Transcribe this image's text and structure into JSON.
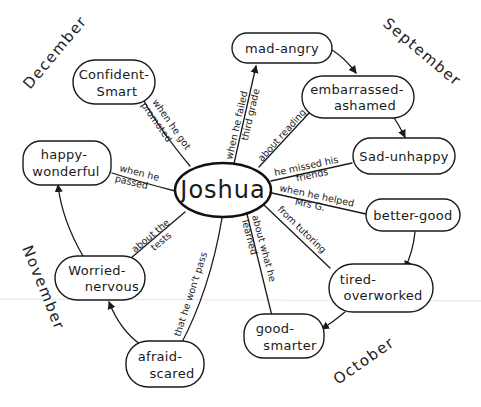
{
  "diagram": {
    "type": "concept-map",
    "center": {
      "label": "Joshua"
    },
    "months": [
      {
        "id": "september",
        "label": "September"
      },
      {
        "id": "october",
        "label": "October"
      },
      {
        "id": "november",
        "label": "November"
      },
      {
        "id": "december",
        "label": "December"
      }
    ],
    "nodes": [
      {
        "id": "mad-angry",
        "lines": [
          "mad-angry"
        ]
      },
      {
        "id": "embarrassed-ashamed",
        "lines": [
          "embarrassed-",
          "ashamed"
        ]
      },
      {
        "id": "sad-unhappy",
        "lines": [
          "Sad-unhappy"
        ]
      },
      {
        "id": "better-good",
        "lines": [
          "better-good"
        ]
      },
      {
        "id": "tired-overworked",
        "lines": [
          "tired-",
          "overworked"
        ]
      },
      {
        "id": "good-smarter",
        "lines": [
          "good-",
          "smarter"
        ]
      },
      {
        "id": "afraid-scared",
        "lines": [
          "afraid-",
          "scared"
        ]
      },
      {
        "id": "worried-nervous",
        "lines": [
          "Worried-",
          "nervous"
        ]
      },
      {
        "id": "happy-wonderful",
        "lines": [
          "happy-",
          "wonderful"
        ]
      },
      {
        "id": "confident-smart",
        "lines": [
          "Confident-",
          "Smart"
        ]
      }
    ],
    "edges": [
      {
        "from": "center",
        "to": "mad-angry",
        "lines": [
          "when he failed",
          "third grade"
        ]
      },
      {
        "from": "center",
        "to": "embarrassed-ashamed",
        "lines": [
          "about reading"
        ]
      },
      {
        "from": "center",
        "to": "sad-unhappy",
        "lines": [
          "he missed his",
          "friends"
        ]
      },
      {
        "from": "center",
        "to": "better-good",
        "lines": [
          "when he helped",
          "Mrs G."
        ]
      },
      {
        "from": "center",
        "to": "tired-overworked",
        "lines": [
          "from tutoring"
        ]
      },
      {
        "from": "center",
        "to": "good-smarter",
        "lines": [
          "about what he",
          "learned"
        ]
      },
      {
        "from": "center",
        "to": "afraid-scared",
        "lines": [
          "that he won't pass"
        ]
      },
      {
        "from": "center",
        "to": "worried-nervous",
        "lines": [
          "about the",
          "tests"
        ]
      },
      {
        "from": "center",
        "to": "happy-wonderful",
        "lines": [
          "when he",
          "passed"
        ]
      },
      {
        "from": "center",
        "to": "confident-smart",
        "lines": [
          "when he got",
          "promoted"
        ]
      }
    ],
    "sequence_arrows": [
      {
        "from": "mad-angry",
        "to": "embarrassed-ashamed"
      },
      {
        "from": "embarrassed-ashamed",
        "to": "sad-unhappy"
      },
      {
        "from": "better-good",
        "to": "tired-overworked"
      },
      {
        "from": "tired-overworked",
        "to": "good-smarter"
      },
      {
        "from": "afraid-scared",
        "to": "worried-nervous"
      },
      {
        "from": "worried-nervous",
        "to": "happy-wonderful"
      }
    ]
  }
}
